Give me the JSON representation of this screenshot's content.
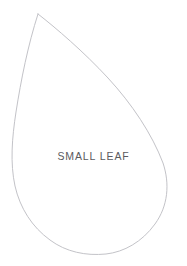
{
  "canvas": {
    "width": 187,
    "height": 266,
    "background_color": "#ffffff"
  },
  "shape": {
    "name": "leaf-outline",
    "kind": "closed-curve-outline",
    "stroke_color": "#c3c3c8",
    "stroke_width": 1,
    "fill": "none",
    "path": "M 38 14 C 56 28 84 52 108 78 C 132 104 152 134 163 163 C 170 184 168 206 155 224 C 142 242 124 252 106 254 C 86 256 66 252 50 240 C 32 227 20 208 15 186 C 10 163 12 138 16 112 C 21 80 28 45 38 14 Z",
    "apex_point": [
      38,
      14
    ],
    "leftmost_point": [
      14,
      140
    ],
    "rightmost_point": [
      166,
      170
    ],
    "bottommost_point": [
      112,
      254
    ]
  },
  "label": {
    "text": "SMALL LEAF",
    "color": "#5a5a5e",
    "font_size_px": 10.5,
    "letter_spacing_px": 0.9,
    "center": [
      80,
      157
    ]
  }
}
